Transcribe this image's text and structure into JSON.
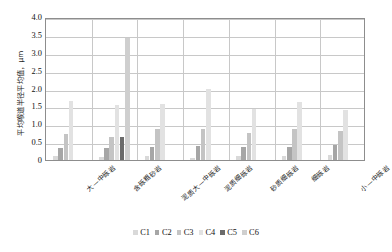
{
  "chart_data": {
    "type": "bar",
    "title": "",
    "subtitle": "",
    "xlabel": "",
    "ylabel": "平均喉道半径平均值，μm",
    "ylim": [
      0,
      4.0
    ],
    "yticks": [
      "0",
      "0.5",
      "1.0",
      "1.5",
      "2.0",
      "2.5",
      "3.0",
      "3.5",
      "4.0"
    ],
    "ytick_values": [
      0,
      0.5,
      1.0,
      1.5,
      2.0,
      2.5,
      3.0,
      3.5,
      4.0
    ],
    "grid": true,
    "legend_position": "bottom",
    "categories": [
      "大—中砾岩",
      "含砾粗砂岩",
      "泥质大—中砾岩",
      "泥质细砾岩",
      "砂质细砾岩",
      "细砾岩",
      "小—中砾岩"
    ],
    "series": [
      {
        "name": "C1",
        "color": "#d9d9d9",
        "values": [
          0.12,
          0.08,
          0.11,
          0.05,
          0.1,
          0.1,
          0.15
        ]
      },
      {
        "name": "C2",
        "color": "#a6a6a6",
        "values": [
          0.35,
          0.33,
          0.36,
          0.4,
          0.36,
          0.37,
          0.43
        ]
      },
      {
        "name": "C3",
        "color": "#c4c4c4",
        "values": [
          0.72,
          0.65,
          0.87,
          0.87,
          0.75,
          0.87,
          0.8
        ]
      },
      {
        "name": "C4",
        "color": "#e2e2e2",
        "values": [
          1.65,
          1.55,
          1.57,
          1.98,
          1.42,
          1.62,
          1.4
        ]
      },
      {
        "name": "C5",
        "color": "#6b6b6b",
        "values": [
          0,
          0.65,
          0,
          0,
          0,
          0,
          0
        ]
      },
      {
        "name": "C6",
        "color": "#cfcfcf",
        "values": [
          0,
          3.42,
          0,
          0,
          0,
          0,
          0
        ]
      }
    ]
  },
  "legend": {
    "items": [
      {
        "label": "C1"
      },
      {
        "label": "C2"
      },
      {
        "label": "C3"
      },
      {
        "label": "C4"
      },
      {
        "label": "C5"
      },
      {
        "label": "C6"
      }
    ]
  },
  "colors": {
    "axis": "#8d8d8d",
    "grid": "#c8c8c8",
    "text": "#111111",
    "background": "#ffffff"
  }
}
